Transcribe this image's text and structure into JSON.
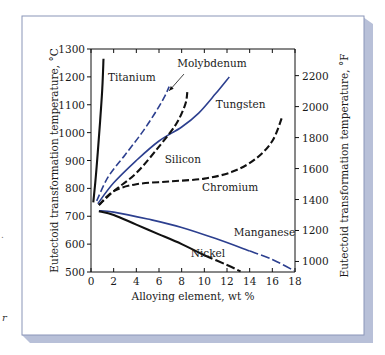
{
  "figure": {
    "panel_background": "#ffffff",
    "panel_border_color": "#8a95b8",
    "panel_shadow_color": "#b8c0d8",
    "left_margin_fragments": [
      ".",
      "r"
    ]
  },
  "chart_data": {
    "type": "line",
    "title": "",
    "xlabel": "Alloying element, wt %",
    "ylabel": "Eutectoid transformation temperature, °C",
    "ylabel_right": "Eutectoid transformation temperature, °F",
    "xlim": [
      0,
      18
    ],
    "ylim": [
      500,
      1300
    ],
    "ylim_right": [
      932,
      2372
    ],
    "grid": false,
    "legend": "inline labels",
    "x_ticks": [
      0,
      2,
      4,
      6,
      8,
      10,
      12,
      14,
      16,
      18
    ],
    "x_tick_labels": [
      "0",
      "2",
      "4",
      "6",
      "8",
      "10",
      "12",
      "14",
      "16",
      "18"
    ],
    "y_ticks": [
      500,
      600,
      700,
      800,
      900,
      1000,
      1100,
      1200,
      1300
    ],
    "y_tick_labels": [
      "500",
      "600",
      "700",
      "800",
      "900",
      "1000",
      "1100",
      "1200",
      "1300"
    ],
    "y_right_ticks_F": [
      1000,
      1200,
      1400,
      1600,
      1800,
      2000,
      2200
    ],
    "y_right_tick_labels": [
      "1000",
      "1200",
      "1400",
      "1600",
      "1800",
      "2000",
      "2200"
    ],
    "series": [
      {
        "name": "Titanium",
        "color": "#111111",
        "style": "solid",
        "x": [
          0.2,
          0.4,
          0.6,
          0.8,
          1.0,
          1.1
        ],
        "y": [
          750,
          830,
          930,
          1040,
          1160,
          1265
        ],
        "label": {
          "text": "Titanium",
          "x": 1.5,
          "y": 1185
        }
      },
      {
        "name": "Molybdenum",
        "color": "#2c3f8f",
        "style": "dashed",
        "x": [
          0.5,
          1.5,
          3.0,
          4.5,
          5.8,
          6.5,
          6.9
        ],
        "y": [
          755,
          840,
          920,
          1000,
          1080,
          1130,
          1165
        ],
        "label": {
          "text": "Molybdenum",
          "x": 7.6,
          "y": 1235
        },
        "annotation_arrow": {
          "from_x": 8.2,
          "from_y": 1210,
          "to_x": 6.9,
          "to_y": 1150
        }
      },
      {
        "name": "Tungsten",
        "color": "#2c3f8f",
        "style": "solid",
        "x": [
          0.6,
          2.0,
          4.0,
          6.0,
          8.0,
          9.5,
          11.0,
          12.2
        ],
        "y": [
          745,
          820,
          900,
          970,
          1020,
          1070,
          1140,
          1200
        ],
        "label": {
          "text": "Tungsten",
          "x": 11.0,
          "y": 1090
        }
      },
      {
        "name": "Silicon",
        "color": "#111111",
        "style": "dashed",
        "x": [
          0.7,
          2.0,
          4.0,
          6.0,
          7.5,
          8.3,
          8.5
        ],
        "y": [
          740,
          790,
          855,
          950,
          1030,
          1100,
          1145
        ],
        "label": {
          "text": "Silicon",
          "x": 6.5,
          "y": 890
        }
      },
      {
        "name": "Chromium",
        "color": "#111111",
        "style": "dashed",
        "x": [
          0.7,
          2.0,
          4.0,
          7.0,
          10.0,
          12.5,
          14.5,
          16.0,
          16.9
        ],
        "y": [
          740,
          790,
          815,
          825,
          835,
          860,
          905,
          970,
          1060
        ],
        "label": {
          "text": "Chromium",
          "x": 9.8,
          "y": 790
        }
      },
      {
        "name": "Manganese",
        "color": "#2c3f8f",
        "style": "solid-then-dashed",
        "x": [
          0.7,
          2.0,
          5.0,
          8.0,
          11.0,
          14.0,
          16.0,
          17.9
        ],
        "y": [
          720,
          715,
          690,
          660,
          620,
          575,
          545,
          505
        ],
        "label": {
          "text": "Manganese",
          "x": 12.6,
          "y": 628
        }
      },
      {
        "name": "Nickel",
        "color": "#111111",
        "style": "solid-then-dashed",
        "x": [
          0.7,
          2.0,
          4.0,
          6.0,
          8.0,
          10.0,
          12.0,
          13.2
        ],
        "y": [
          718,
          705,
          670,
          635,
          600,
          560,
          525,
          502
        ],
        "label": {
          "text": "Nickel",
          "x": 8.8,
          "y": 555
        }
      }
    ]
  }
}
